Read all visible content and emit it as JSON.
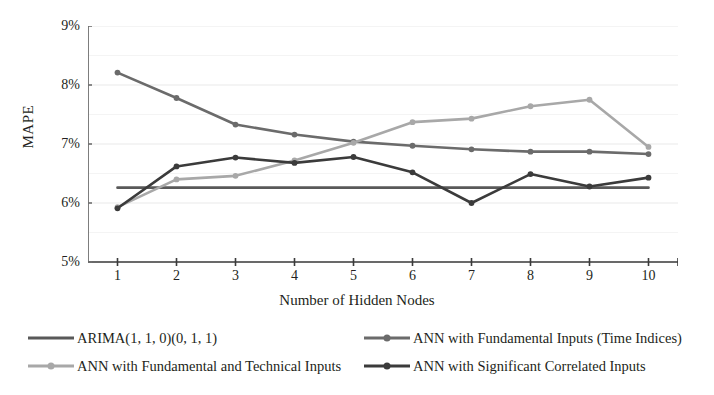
{
  "chart_data": {
    "type": "line",
    "title": "",
    "xlabel": "Number of Hidden Nodes",
    "ylabel": "MAPE",
    "x": [
      1,
      2,
      3,
      4,
      5,
      6,
      7,
      8,
      9,
      10
    ],
    "xtick_labels": [
      "1",
      "2",
      "3",
      "4",
      "5",
      "6",
      "7",
      "8",
      "9",
      "10"
    ],
    "ytick_labels": [
      "9%",
      "8%",
      "7%",
      "6%",
      "5%"
    ],
    "ytick_values": [
      9,
      8,
      7,
      6,
      5
    ],
    "ylim": [
      5,
      9
    ],
    "xlim": [
      0.5,
      10.5
    ],
    "grid": "horizontal",
    "legend_position": "bottom",
    "series": [
      {
        "name": "ARIMA(1, 1, 0)(0, 1, 1)",
        "color": "#595959",
        "markers": false,
        "values": [
          6.26,
          6.26,
          6.26,
          6.26,
          6.26,
          6.26,
          6.26,
          6.26,
          6.26,
          6.26
        ]
      },
      {
        "name": "ANN with Fundamental Inputs (Time Indices)",
        "color": "#6b6b6b",
        "markers": true,
        "values": [
          8.21,
          7.78,
          7.33,
          7.16,
          7.04,
          6.97,
          6.91,
          6.87,
          6.87,
          6.83
        ]
      },
      {
        "name": "ANN with Fundamental and Technical Inputs",
        "color": "#a8a8a8",
        "markers": true,
        "values": [
          5.93,
          6.4,
          6.46,
          6.72,
          7.02,
          7.37,
          7.43,
          7.64,
          7.75,
          6.95
        ]
      },
      {
        "name": "ANN with Significant Correlated Inputs",
        "color": "#3b3b3b",
        "markers": true,
        "values": [
          5.91,
          6.62,
          6.77,
          6.68,
          6.78,
          6.52,
          6.0,
          6.49,
          6.28,
          6.43
        ]
      }
    ]
  },
  "legend": {
    "entries": [
      {
        "label": "ARIMA(1, 1, 0)(0, 1, 1)",
        "color": "#595959",
        "marker": false
      },
      {
        "label": "ANN with Fundamental Inputs (Time Indices)",
        "color": "#6b6b6b",
        "marker": true
      },
      {
        "label": "ANN with Fundamental and Technical Inputs",
        "color": "#a8a8a8",
        "marker": true
      },
      {
        "label": "ANN with Significant Correlated Inputs",
        "color": "#3b3b3b",
        "marker": true
      }
    ]
  }
}
